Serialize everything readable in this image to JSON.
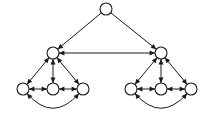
{
  "figure": {
    "background_color": "#ffffff",
    "stroke_color": "#1a1a1a",
    "node_fill_color": "#ffffff",
    "node_radius": 6,
    "width": 213,
    "height": 116
  },
  "chart_data": {
    "type": "diagram",
    "layout": "hierarchical-tree",
    "title": "",
    "nodes": [
      {
        "id": "root",
        "label": "",
        "x": 106,
        "y": 9,
        "level": 0,
        "cluster": "root"
      },
      {
        "id": "l0",
        "label": "",
        "x": 53,
        "y": 53,
        "level": 1,
        "cluster": "left"
      },
      {
        "id": "r0",
        "label": "",
        "x": 161,
        "y": 53,
        "level": 1,
        "cluster": "right"
      },
      {
        "id": "l1",
        "label": "",
        "x": 23,
        "y": 89,
        "level": 2,
        "cluster": "left"
      },
      {
        "id": "l2",
        "label": "",
        "x": 53,
        "y": 89,
        "level": 2,
        "cluster": "left"
      },
      {
        "id": "l3",
        "label": "",
        "x": 83,
        "y": 89,
        "level": 2,
        "cluster": "left"
      },
      {
        "id": "r1",
        "label": "",
        "x": 131,
        "y": 89,
        "level": 2,
        "cluster": "right"
      },
      {
        "id": "r2",
        "label": "",
        "x": 161,
        "y": 89,
        "level": 2,
        "cluster": "right"
      },
      {
        "id": "r3",
        "label": "",
        "x": 191,
        "y": 89,
        "level": 2,
        "cluster": "right"
      }
    ],
    "edges": [
      {
        "from": "root",
        "to": "l0",
        "style": "straight",
        "arrows": "single"
      },
      {
        "from": "root",
        "to": "r0",
        "style": "straight",
        "arrows": "single"
      },
      {
        "from": "l0",
        "to": "r0",
        "style": "straight",
        "arrows": "double"
      },
      {
        "from": "l0",
        "to": "l1",
        "style": "straight",
        "arrows": "double"
      },
      {
        "from": "l0",
        "to": "l2",
        "style": "straight",
        "arrows": "double"
      },
      {
        "from": "l0",
        "to": "l3",
        "style": "straight",
        "arrows": "double"
      },
      {
        "from": "l1",
        "to": "l2",
        "style": "straight",
        "arrows": "double"
      },
      {
        "from": "l2",
        "to": "l3",
        "style": "straight",
        "arrows": "double"
      },
      {
        "from": "l1",
        "to": "l3",
        "style": "arc-below",
        "arrows": "double"
      },
      {
        "from": "r0",
        "to": "r1",
        "style": "straight",
        "arrows": "double"
      },
      {
        "from": "r0",
        "to": "r2",
        "style": "straight",
        "arrows": "double"
      },
      {
        "from": "r0",
        "to": "r3",
        "style": "straight",
        "arrows": "double"
      },
      {
        "from": "r1",
        "to": "r2",
        "style": "straight",
        "arrows": "double"
      },
      {
        "from": "r2",
        "to": "r3",
        "style": "straight",
        "arrows": "double"
      },
      {
        "from": "r1",
        "to": "r3",
        "style": "arc-below",
        "arrows": "double"
      }
    ],
    "legend": [],
    "annotations": []
  }
}
